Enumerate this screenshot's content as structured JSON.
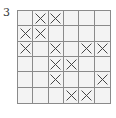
{
  "label": "3",
  "grid": {
    "rows": 6,
    "cols": 6,
    "cells": [
      [
        0,
        1,
        1,
        0,
        0,
        0
      ],
      [
        1,
        1,
        0,
        0,
        0,
        0
      ],
      [
        1,
        0,
        1,
        0,
        1,
        1
      ],
      [
        0,
        0,
        1,
        1,
        0,
        0
      ],
      [
        0,
        0,
        1,
        0,
        0,
        1
      ],
      [
        0,
        0,
        0,
        1,
        1,
        0
      ]
    ],
    "mark_symbol": "x-mark-icon",
    "colors": {
      "cell_fill": "#f3f3f3",
      "line": "#8a8a8a",
      "mark": "#444444"
    }
  }
}
